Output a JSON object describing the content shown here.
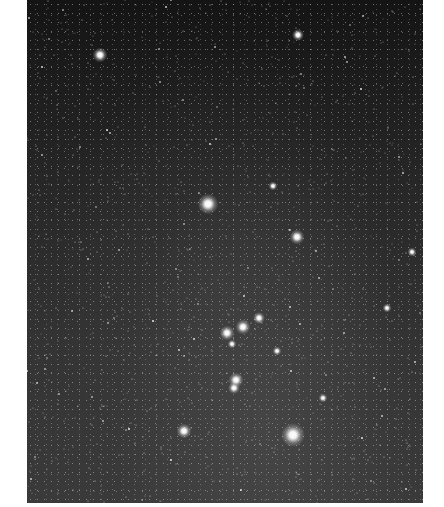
{
  "image": {
    "subject": "Orion constellation night-sky photograph",
    "frame": {
      "x": 27,
      "y": 0,
      "width": 396,
      "height": 503
    },
    "background_color": "#2a2a2a"
  },
  "bright_stars": [
    {
      "name": "star-top-left",
      "x": 100,
      "y": 55,
      "size": 5
    },
    {
      "name": "star-top-center",
      "x": 298,
      "y": 35,
      "size": 4
    },
    {
      "name": "betelgeuse",
      "x": 208,
      "y": 204,
      "size": 7
    },
    {
      "name": "bellatrix",
      "x": 297,
      "y": 237,
      "size": 5
    },
    {
      "name": "meissa-cluster",
      "x": 273,
      "y": 186,
      "size": 3
    },
    {
      "name": "alnitak",
      "x": 227,
      "y": 333,
      "size": 5
    },
    {
      "name": "alnilam",
      "x": 243,
      "y": 327,
      "size": 5
    },
    {
      "name": "mintaka",
      "x": 259,
      "y": 318,
      "size": 4
    },
    {
      "name": "belt-minor",
      "x": 232,
      "y": 344,
      "size": 3
    },
    {
      "name": "belt-right",
      "x": 277,
      "y": 351,
      "size": 3
    },
    {
      "name": "orion-nebula-a",
      "x": 236,
      "y": 380,
      "size": 5
    },
    {
      "name": "orion-nebula-b",
      "x": 234,
      "y": 388,
      "size": 4
    },
    {
      "name": "saiph",
      "x": 184,
      "y": 431,
      "size": 5
    },
    {
      "name": "rigel",
      "x": 293,
      "y": 435,
      "size": 8
    },
    {
      "name": "star-right",
      "x": 387,
      "y": 308,
      "size": 3
    },
    {
      "name": "star-right-lower",
      "x": 323,
      "y": 398,
      "size": 3
    },
    {
      "name": "star-far-right",
      "x": 412,
      "y": 252,
      "size": 3
    }
  ]
}
